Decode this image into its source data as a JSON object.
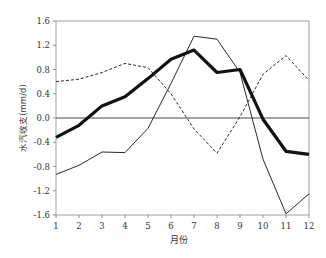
{
  "chart_data": {
    "type": "line",
    "title": "",
    "xlabel": "月份",
    "ylabel": "水汽收支(mm/d)",
    "x": [
      1,
      2,
      3,
      4,
      5,
      6,
      7,
      8,
      9,
      10,
      11,
      12
    ],
    "x_tick_labels": [
      "1",
      "2",
      "3",
      "4",
      "5",
      "6",
      "7",
      "8",
      "9",
      "10",
      "11",
      "12"
    ],
    "y_tick_values": [
      1.6,
      1.2,
      0.8,
      0.4,
      0.0,
      -0.4,
      -0.8,
      -1.2,
      -1.6
    ],
    "y_tick_labels": [
      "1.6",
      "1.2",
      "0.8",
      "0.4",
      "0.0",
      "-0.4",
      "-0.8",
      "-1.2",
      "-1.6"
    ],
    "ylim": [
      -1.6,
      1.6
    ],
    "xlim": [
      1,
      12
    ],
    "grid": false,
    "zero_line": true,
    "legend": null,
    "series": [
      {
        "name": "thick-solid",
        "style": "solid",
        "width": 3.2,
        "values": [
          -0.32,
          -0.12,
          0.2,
          0.35,
          0.65,
          0.97,
          1.12,
          0.75,
          0.8,
          -0.02,
          -0.55,
          -0.6
        ]
      },
      {
        "name": "thin-solid",
        "style": "solid",
        "width": 0.9,
        "values": [
          -0.93,
          -0.78,
          -0.56,
          -0.57,
          -0.17,
          0.57,
          1.35,
          1.3,
          0.75,
          -0.68,
          -1.58,
          -1.25
        ]
      },
      {
        "name": "dashed",
        "style": "dashed",
        "width": 0.9,
        "values": [
          0.6,
          0.64,
          0.75,
          0.9,
          0.83,
          0.4,
          -0.18,
          -0.58,
          0.02,
          0.72,
          1.03,
          0.62
        ]
      }
    ]
  }
}
